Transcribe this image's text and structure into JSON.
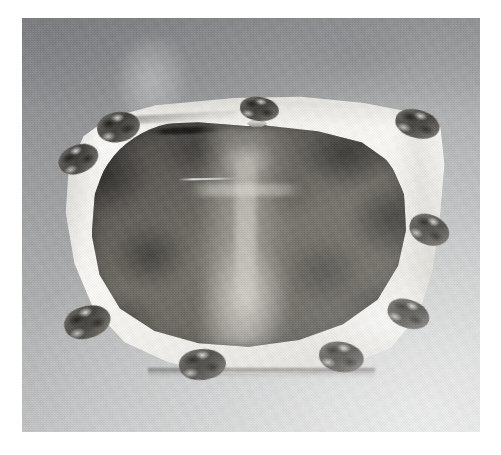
{
  "document": {
    "kind": "photographic-plate",
    "page_background": "#ffffff",
    "caption_text": ""
  },
  "photo": {
    "name": "archival-black-and-white-photograph",
    "colorspace": "grayscale",
    "left": 22,
    "top": 18,
    "width": 458,
    "height": 414,
    "background_tone": "#a9aaac",
    "background_description": "flat mid-grey studio backdrop, brighter toward the lower-right corner",
    "reproduction_texture": "halftone scanlines from a printed reproduction",
    "light_smudge_note": "pale blurred smudge on the backdrop above the object, left of centre"
  },
  "artifact": {
    "name": "stretched-rawhide-panel",
    "description": "Irregular rounded-rectangular stretched hide: a dark mottled central panel framed by a broad pale cream rawhide border, laced with knots at eight points around the perimeter.",
    "border": {
      "label": "pale rawhide border",
      "color_light": "#fbfaf6",
      "color_mid": "#e4e3dd",
      "color_shadow": "#d6d5ce"
    },
    "interior": {
      "label": "dark mottled hide panel",
      "color_dark": "#4d4a46",
      "color_mid": "#6a675f",
      "color_blotch": "#262421",
      "features": [
        "pale vertical band down the centre",
        "faint ghost image resembling a cross or standing figure",
        "thin bright scratch left of the cross arm",
        "dark horizontal slit near the upper-left edge",
        "small pointed tab at the top centre"
      ]
    },
    "lacing_knots": {
      "label": "rawhide lacing knot",
      "count": 9,
      "color_dark": "#3e3c39",
      "color_light": "#faf9f5",
      "positions": [
        {
          "id": "knot-top-left",
          "x": 11.0,
          "y": 6.5,
          "w": 11.0,
          "h": 10.5,
          "rot": -12
        },
        {
          "id": "knot-top-centre",
          "x": 47.5,
          "y": 1.0,
          "w": 10.0,
          "h": 8.5,
          "rot": 6
        },
        {
          "id": "knot-top-right",
          "x": 87.0,
          "y": 5.5,
          "w": 11.5,
          "h": 10.0,
          "rot": 14
        },
        {
          "id": "knot-left-upper",
          "x": 1.0,
          "y": 18.0,
          "w": 10.5,
          "h": 10.0,
          "rot": -24
        },
        {
          "id": "knot-right-middle",
          "x": 90.5,
          "y": 43.0,
          "w": 10.5,
          "h": 10.5,
          "rot": 20
        },
        {
          "id": "knot-left-lower",
          "x": 2.5,
          "y": 75.0,
          "w": 12.0,
          "h": 11.5,
          "rot": -18
        },
        {
          "id": "knot-right-lower",
          "x": 85.0,
          "y": 73.0,
          "w": 11.0,
          "h": 10.0,
          "rot": 18
        },
        {
          "id": "knot-bottom-left",
          "x": 32.0,
          "y": 90.5,
          "w": 12.0,
          "h": 11.0,
          "rot": -6
        },
        {
          "id": "knot-bottom-right",
          "x": 67.5,
          "y": 88.0,
          "w": 11.5,
          "h": 10.5,
          "rot": 8
        }
      ]
    }
  }
}
